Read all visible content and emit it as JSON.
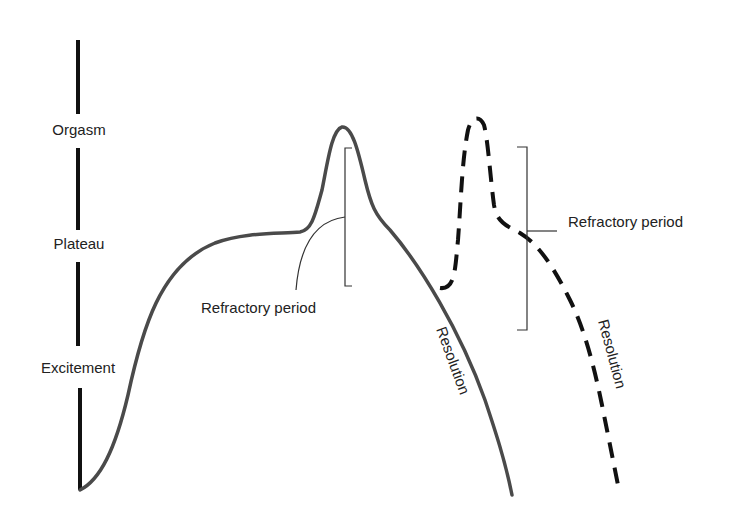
{
  "diagram": {
    "type": "sexual-response-cycle",
    "colors": {
      "axis": "#111111",
      "curve": "#4a4a4a",
      "dashed_curve": "#111111",
      "bracket": "#333333",
      "text": "#222222",
      "background": "#ffffff"
    },
    "axis_labels": {
      "orgasm": "Orgasm",
      "plateau": "Plateau",
      "excitement": "Excitement"
    },
    "annotations": {
      "refractory_period_1": "Refractory period",
      "refractory_period_2": "Refractory period",
      "resolution_1": "Resolution",
      "resolution_2": "Resolution"
    },
    "curves": [
      {
        "name": "primary-response-curve",
        "style": "solid"
      },
      {
        "name": "secondary-response-curve",
        "style": "dashed"
      }
    ]
  }
}
